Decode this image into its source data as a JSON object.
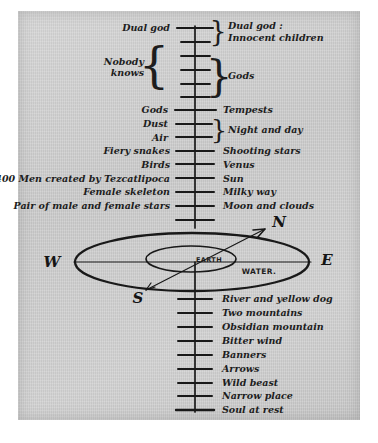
{
  "figure": {
    "paper_color": "#cacaca",
    "ink_color": "#1d1d1d"
  },
  "axis": {
    "name": "vertical-world-axis",
    "upper_tick_count": 13,
    "lower_tick_count": 9
  },
  "upper_levels": [
    {
      "left": "Dual god",
      "right": "Dual god :",
      "right2": "Innocent children"
    },
    {
      "left": "",
      "right": ""
    },
    {
      "left": "Nobody",
      "left2": "knows",
      "right": ""
    },
    {
      "left": "",
      "right": "Gods"
    },
    {
      "left": "",
      "right": ""
    },
    {
      "left": "",
      "right": ""
    },
    {
      "left": "Gods",
      "right": "Tempests"
    },
    {
      "left": "Dust",
      "right": "Night and day"
    },
    {
      "left": "Air",
      "right": ""
    },
    {
      "left": "Fiery snakes",
      "right": "Shooting stars"
    },
    {
      "left": "Birds",
      "right": "Venus"
    },
    {
      "left": "400 Men created by Tezcatlipoca",
      "right": "Sun"
    },
    {
      "left": "Female skeleton",
      "right": "Milky way"
    },
    {
      "left": "Pair of male and female stars",
      "right": "Moon and clouds"
    }
  ],
  "braces": {
    "dual_god_right": "}",
    "nobody_knows_left": "{",
    "gods_right": "}",
    "night_and_day_right": "}"
  },
  "earth_plane": {
    "west_label": "W",
    "east_label": "E",
    "north_label": "N",
    "south_label": "S",
    "earth_label": "EARTH",
    "water_label": "WATER."
  },
  "lower_levels": [
    "River and yellow dog",
    "Two mountains",
    "Obsidian mountain",
    "Bitter wind",
    "Banners",
    "Arrows",
    "Wild beast",
    "Narrow place",
    "Soul at rest"
  ]
}
